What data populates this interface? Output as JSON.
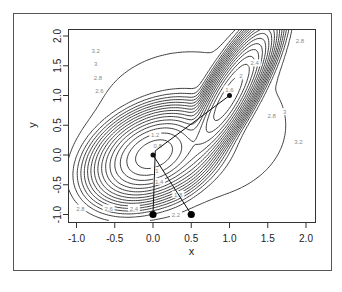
{
  "chart_data": {
    "type": "contour",
    "title": "",
    "xlabel": "x",
    "ylabel": "y",
    "xlim": [
      -1.1,
      2.1
    ],
    "ylim": [
      -1.1,
      2.1
    ],
    "x_ticks": [
      -1.0,
      -0.5,
      0.0,
      0.5,
      1.0,
      1.5,
      2.0
    ],
    "x_tick_labels": [
      "-1.0",
      "-0.5",
      "0.0",
      "0.5",
      "1.0",
      "1.5",
      "2.0"
    ],
    "y_ticks": [
      -1.0,
      -0.5,
      0.0,
      0.5,
      1.0,
      1.5,
      2.0
    ],
    "y_tick_labels": [
      "-1.0",
      "-0.5",
      "0.0",
      "0.5",
      "1.0",
      "1.5",
      "2.0"
    ],
    "grid": false,
    "legend": null,
    "contour_levels": [
      0.2,
      0.4,
      0.6,
      0.8,
      1.0,
      1.2,
      1.4,
      1.6,
      1.8,
      2.0,
      2.2,
      2.4,
      2.6,
      2.8,
      3.0,
      3.2
    ],
    "contour_labels": [
      {
        "text": "3.2",
        "x": -0.75,
        "y": 1.75
      },
      {
        "text": "3",
        "x": -0.75,
        "y": 1.53
      },
      {
        "text": "2.8",
        "x": -0.72,
        "y": 1.3
      },
      {
        "text": "2.6",
        "x": -0.7,
        "y": 1.08
      },
      {
        "text": "1.2",
        "x": 0.03,
        "y": 0.33
      },
      {
        "text": "0.8",
        "x": 0.06,
        "y": 0.15
      },
      {
        "text": "1.4",
        "x": 0.08,
        "y": -0.45
      },
      {
        "text": "1",
        "x": 0.05,
        "y": -0.27
      },
      {
        "text": "1.8",
        "x": 0.33,
        "y": -0.67
      },
      {
        "text": "2.2",
        "x": 0.3,
        "y": -1.0
      },
      {
        "text": "2.4",
        "x": -0.25,
        "y": -0.9
      },
      {
        "text": "2.6",
        "x": -0.58,
        "y": -0.9
      },
      {
        "text": "2.8",
        "x": -0.95,
        "y": -0.9
      },
      {
        "text": "2.8",
        "x": 1.92,
        "y": 1.92
      },
      {
        "text": "2.4",
        "x": 1.33,
        "y": 1.54
      },
      {
        "text": "2",
        "x": 1.15,
        "y": 1.32
      },
      {
        "text": "1.6",
        "x": 1.0,
        "y": 1.1
      },
      {
        "text": "2.8",
        "x": 1.55,
        "y": 0.65
      },
      {
        "text": "3",
        "x": 1.72,
        "y": 0.72
      },
      {
        "text": "3.2",
        "x": 1.9,
        "y": 0.22
      }
    ],
    "surface": {
      "description": "two-well surface with minima near (0,0) and (1,1)",
      "minima": [
        {
          "x": 0.0,
          "y": 0.0,
          "depth": 0.0,
          "sx": 0.28,
          "sy": 0.28,
          "rho": 0.35
        },
        {
          "x": 1.0,
          "y": 1.0,
          "depth": 0.0,
          "sx": 0.22,
          "sy": 0.45,
          "rho": 0.85
        }
      ]
    },
    "paths": [
      {
        "name": "path-from-0",
        "points": [
          [
            0.0,
            -1.0
          ],
          [
            0.03,
            0.07
          ],
          [
            1.0,
            1.0
          ]
        ]
      },
      {
        "name": "path-from-0.5",
        "points": [
          [
            0.5,
            -1.0
          ],
          [
            0.0,
            0.0
          ]
        ]
      }
    ],
    "start_points": [
      {
        "x": 0.0,
        "y": -1.0
      },
      {
        "x": 0.5,
        "y": -1.0
      }
    ]
  },
  "layout": {
    "frame": {
      "x": 13,
      "y": 13,
      "w": 318,
      "h": 257
    },
    "plot": {
      "left": 68,
      "top": 29,
      "right": 315,
      "bottom": 222
    },
    "x_scale": {
      "v0": 0.0,
      "px0": 153,
      "px_per_unit": 76.5
    },
    "y_scale": {
      "v0": 0.0,
      "px0": 155,
      "px_per_unit": 59.5
    }
  }
}
